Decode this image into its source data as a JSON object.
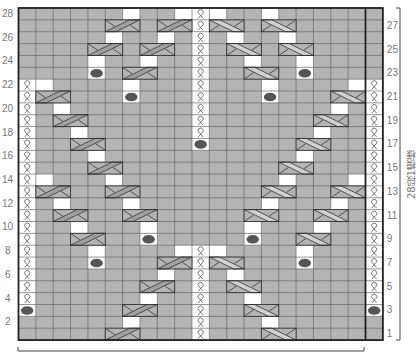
{
  "chart": {
    "rows": 28,
    "cols": 21,
    "grid": {
      "left": 18.5,
      "top": 8,
      "cell_w": 17.35,
      "cell_h": 11.86
    },
    "colors": {
      "bg": "#b4b4b4",
      "white": "#ffffff",
      "line": "#5a5a5a",
      "border": "#222222",
      "dot": "#555555",
      "cable_band_dark": "#a0a0a0",
      "cable_band_light": "#d2d2d2"
    },
    "left_row_labels": [
      "28",
      "26",
      "24",
      "22",
      "20",
      "18",
      "16",
      "14",
      "12",
      "10",
      "8",
      "6",
      "4",
      "2"
    ],
    "right_row_labels": [
      "27",
      "25",
      "23",
      "21",
      "19",
      "17",
      "15",
      "13",
      "11",
      "9",
      "7",
      "5",
      "3",
      "1"
    ],
    "side_label": "28段1模様",
    "legend": {
      "twist": "twisted knit stitch (Q)",
      "white": "no stitch",
      "dot": "bobble",
      "cableR": "cable cross (right)",
      "cableL": "cable cross (left)"
    },
    "cells": {
      "28": {
        "white": [
          6,
          9,
          11,
          14
        ],
        "twist": [
          10
        ]
      },
      "27": {
        "cableR": [
          5,
          8
        ],
        "cableL": [
          11,
          14
        ],
        "twist": [
          10
        ]
      },
      "26": {
        "white": [
          5,
          8,
          12,
          15
        ],
        "twist": [
          10
        ]
      },
      "25": {
        "cableR": [
          4,
          7
        ],
        "cableL": [
          12,
          15
        ],
        "twist": [
          10
        ]
      },
      "24": {
        "white": [
          4,
          7,
          13,
          16
        ],
        "twist": [
          10
        ]
      },
      "23": {
        "dot": [
          4,
          16
        ],
        "cableR": [
          6
        ],
        "cableL": [
          13
        ],
        "twist": [
          10
        ]
      },
      "22": {
        "white": [
          1,
          6,
          14,
          19
        ],
        "twist": [
          0,
          10,
          20
        ]
      },
      "21": {
        "cableR": [
          1
        ],
        "cableL": [
          18
        ],
        "dot": [
          6,
          14
        ],
        "twist": [
          0,
          10,
          20
        ]
      },
      "20": {
        "white": [
          2,
          18
        ],
        "twist": [
          0,
          10,
          20
        ]
      },
      "19": {
        "cableR": [
          2
        ],
        "cableL": [
          17
        ],
        "twist": [
          0,
          10,
          20
        ]
      },
      "18": {
        "white": [
          3,
          17
        ],
        "twist": [
          0,
          10,
          20
        ]
      },
      "17": {
        "cableR": [
          3
        ],
        "cableL": [
          16
        ],
        "dot": [
          10
        ],
        "twist": [
          0,
          20
        ]
      },
      "16": {
        "white": [
          4,
          16
        ],
        "twist": [
          0,
          20
        ]
      },
      "15": {
        "cableR": [
          4
        ],
        "cableL": [
          15
        ],
        "twist": [
          0,
          20
        ]
      },
      "14": {
        "white": [
          1,
          5,
          15,
          19
        ],
        "twist": [
          0,
          20
        ]
      },
      "13": {
        "cableR": [
          1,
          5
        ],
        "cableL": [
          14,
          18
        ],
        "twist": [
          0,
          20
        ]
      },
      "12": {
        "white": [
          2,
          6,
          14,
          18
        ],
        "twist": [
          0,
          20
        ]
      },
      "11": {
        "cableR": [
          2,
          6
        ],
        "cableL": [
          13,
          17
        ],
        "twist": [
          0,
          20
        ]
      },
      "10": {
        "white": [
          3,
          7,
          13,
          17
        ],
        "twist": [
          0,
          20
        ]
      },
      "9": {
        "cableR": [
          3
        ],
        "cableL": [
          16
        ],
        "dot": [
          7,
          13
        ],
        "twist": [
          0,
          20
        ]
      },
      "8": {
        "white": [
          4,
          9,
          11,
          16
        ],
        "twist": [
          0,
          10,
          20
        ]
      },
      "7": {
        "dot": [
          4,
          16
        ],
        "cableR": [
          8
        ],
        "cableL": [
          11
        ],
        "twist": [
          0,
          10,
          20
        ]
      },
      "6": {
        "white": [
          8,
          12
        ],
        "twist": [
          0,
          10,
          20
        ]
      },
      "5": {
        "cableR": [
          7
        ],
        "cableL": [
          12
        ],
        "twist": [
          0,
          10,
          20
        ]
      },
      "4": {
        "white": [
          7,
          13
        ],
        "twist": [
          0,
          10,
          20
        ]
      },
      "3": {
        "dot": [
          0,
          20
        ],
        "cableR": [
          6
        ],
        "cableL": [
          13
        ],
        "twist": [
          10
        ]
      },
      "2": {
        "white": [
          6,
          14
        ],
        "twist": [
          10
        ]
      },
      "1": {
        "cableR": [
          5
        ],
        "cableL": [
          14
        ],
        "twist": [
          10
        ]
      }
    },
    "brackets": {
      "bottom": {
        "x1": 18,
        "x2": 364,
        "y": 351
      },
      "right": {
        "x": 400,
        "y1": 8,
        "y2": 340
      }
    }
  }
}
